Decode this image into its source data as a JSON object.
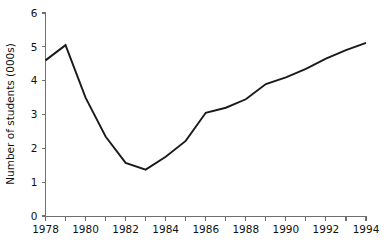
{
  "chart_data": {
    "type": "line",
    "title": "",
    "xlabel": "",
    "ylabel": "Number of students (000s)",
    "x": [
      1978,
      1979,
      1980,
      1981,
      1982,
      1983,
      1984,
      1985,
      1986,
      1987,
      1988,
      1989,
      1990,
      1991,
      1992,
      1993,
      1994
    ],
    "values": [
      4.6,
      5.05,
      3.5,
      2.35,
      1.57,
      1.37,
      1.75,
      2.22,
      3.05,
      3.2,
      3.45,
      3.9,
      4.1,
      4.35,
      4.65,
      4.9,
      5.12
    ],
    "series": [
      {
        "name": "Number of students",
        "values": [
          4.6,
          5.05,
          3.5,
          2.35,
          1.57,
          1.37,
          1.75,
          2.22,
          3.05,
          3.2,
          3.45,
          3.9,
          4.1,
          4.35,
          4.65,
          4.9,
          5.12
        ]
      }
    ],
    "xlim": [
      1978,
      1994
    ],
    "ylim": [
      0,
      6
    ],
    "xticks": [
      1978,
      1979,
      1980,
      1981,
      1982,
      1983,
      1984,
      1985,
      1986,
      1987,
      1988,
      1989,
      1990,
      1991,
      1992,
      1993,
      1994
    ],
    "xtick_labels": [
      "1978",
      "",
      "1980",
      "",
      "1982",
      "",
      "1984",
      "",
      "1986",
      "",
      "1988",
      "",
      "1990",
      "",
      "1992",
      "",
      "1994"
    ],
    "yticks": [
      0,
      1,
      2,
      3,
      4,
      5,
      6
    ],
    "ytick_labels": [
      "0",
      "1",
      "2",
      "3",
      "4",
      "5",
      "6"
    ],
    "grid": false,
    "legend": false,
    "line_color": "#1a1a1a",
    "axis_color": "#6f6f6f",
    "background_color": "#ffffff"
  }
}
